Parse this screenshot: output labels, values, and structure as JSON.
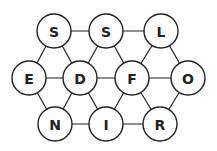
{
  "diagram": {
    "type": "hexagonal letter grid",
    "nodes": [
      {
        "id": "n0",
        "letter": "S",
        "x": 54,
        "y": 31
      },
      {
        "id": "n1",
        "letter": "S",
        "x": 106,
        "y": 31
      },
      {
        "id": "n2",
        "letter": "L",
        "x": 161,
        "y": 31
      },
      {
        "id": "n3",
        "letter": "E",
        "x": 29,
        "y": 78
      },
      {
        "id": "n4",
        "letter": "D",
        "x": 80,
        "y": 78
      },
      {
        "id": "n5",
        "letter": "F",
        "x": 132,
        "y": 78
      },
      {
        "id": "n6",
        "letter": "O",
        "x": 188,
        "y": 78
      },
      {
        "id": "n7",
        "letter": "N",
        "x": 55,
        "y": 124
      },
      {
        "id": "n8",
        "letter": "I",
        "x": 106,
        "y": 124
      },
      {
        "id": "n9",
        "letter": "R",
        "x": 160,
        "y": 124
      }
    ],
    "edges": [
      [
        "n0",
        "n1"
      ],
      [
        "n1",
        "n2"
      ],
      [
        "n3",
        "n4"
      ],
      [
        "n4",
        "n5"
      ],
      [
        "n5",
        "n6"
      ],
      [
        "n7",
        "n8"
      ],
      [
        "n8",
        "n9"
      ],
      [
        "n0",
        "n3"
      ],
      [
        "n0",
        "n4"
      ],
      [
        "n1",
        "n4"
      ],
      [
        "n1",
        "n5"
      ],
      [
        "n2",
        "n5"
      ],
      [
        "n2",
        "n6"
      ],
      [
        "n3",
        "n7"
      ],
      [
        "n4",
        "n7"
      ],
      [
        "n4",
        "n8"
      ],
      [
        "n5",
        "n8"
      ],
      [
        "n5",
        "n9"
      ],
      [
        "n6",
        "n9"
      ]
    ]
  }
}
